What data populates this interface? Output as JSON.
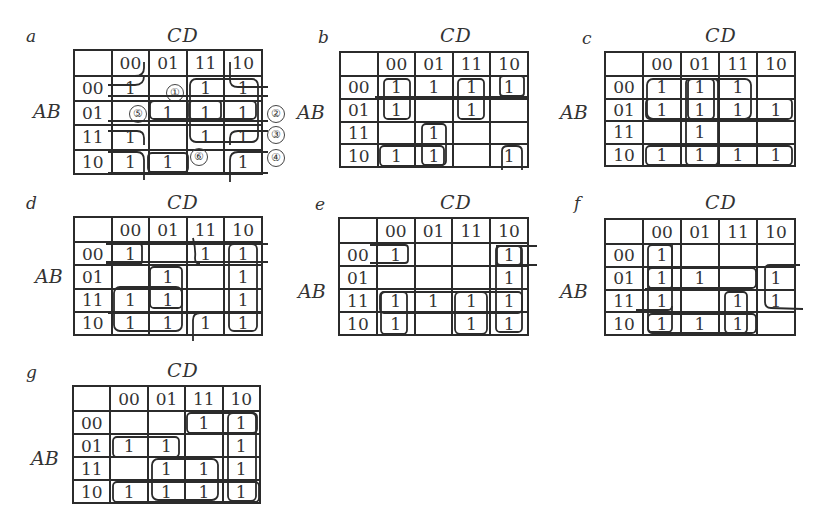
{
  "figure": {
    "row_variable": "AB",
    "column_variable": "CD",
    "column_headers": [
      "00",
      "01",
      "11",
      "10"
    ],
    "row_headers": [
      "00",
      "01",
      "11",
      "10"
    ],
    "maps": [
      {
        "label": "a",
        "cells": [
          [
            "1",
            "",
            "1",
            "1"
          ],
          [
            "",
            "1",
            "1",
            "1"
          ],
          [
            "1",
            "",
            "1",
            "1"
          ],
          [
            "1",
            "1",
            "",
            "1"
          ]
        ],
        "circled_markers": [
          {
            "text": "①",
            "row": 0,
            "col": 1
          },
          {
            "text": "⑤",
            "row": 1,
            "col": 0
          },
          {
            "text": "⑥",
            "row": 3,
            "col": 2
          },
          {
            "text": "②",
            "row": 1,
            "col": "right"
          },
          {
            "text": "③",
            "row": 2,
            "col": "right"
          },
          {
            "text": "④",
            "row": 3,
            "col": "right"
          }
        ]
      },
      {
        "label": "b",
        "cells": [
          [
            "1",
            "1",
            "1",
            "1"
          ],
          [
            "1",
            "",
            "1",
            ""
          ],
          [
            "",
            "1",
            "",
            ""
          ],
          [
            "1",
            "1",
            "",
            "1"
          ]
        ]
      },
      {
        "label": "c",
        "cells": [
          [
            "1",
            "1",
            "1",
            ""
          ],
          [
            "1",
            "1",
            "1",
            "1"
          ],
          [
            "",
            "1",
            "",
            ""
          ],
          [
            "1",
            "1",
            "1",
            "1"
          ]
        ]
      },
      {
        "label": "d",
        "cells": [
          [
            "1",
            "",
            "1",
            "1"
          ],
          [
            "",
            "1",
            "",
            "1"
          ],
          [
            "1",
            "1",
            "",
            "1"
          ],
          [
            "1",
            "1",
            "1",
            "1"
          ]
        ]
      },
      {
        "label": "e",
        "cells": [
          [
            "1",
            "",
            "",
            "1"
          ],
          [
            "",
            "",
            "",
            "1"
          ],
          [
            "1",
            "1",
            "1",
            "1"
          ],
          [
            "1",
            "",
            "1",
            "1"
          ]
        ]
      },
      {
        "label": "f",
        "cells": [
          [
            "1",
            "",
            "",
            ""
          ],
          [
            "1",
            "1",
            "",
            "1"
          ],
          [
            "1",
            "",
            "1",
            "1"
          ],
          [
            "1",
            "1",
            "1",
            ""
          ]
        ]
      },
      {
        "label": "g",
        "cells": [
          [
            "",
            "",
            "1",
            "1"
          ],
          [
            "1",
            "1",
            "",
            "1"
          ],
          [
            "",
            "1",
            "1",
            "1"
          ],
          [
            "1",
            "1",
            "1",
            "1"
          ]
        ]
      }
    ]
  }
}
